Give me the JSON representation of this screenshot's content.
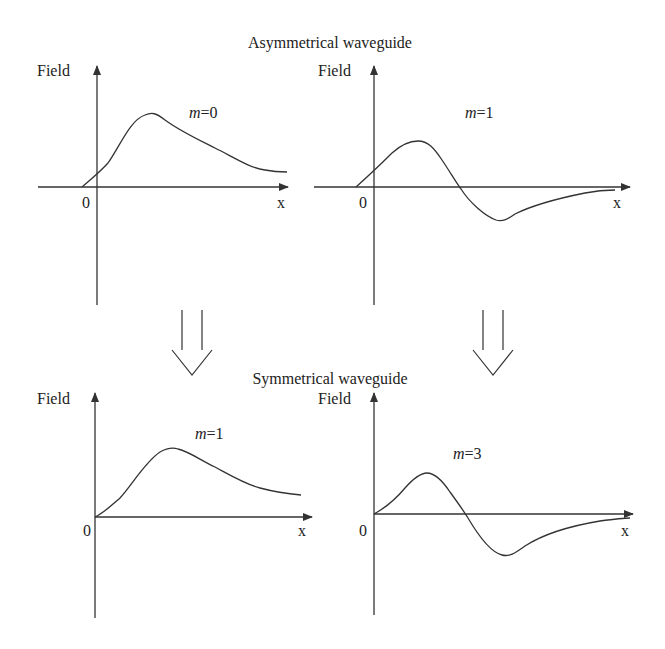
{
  "titles": {
    "top": "Asymmetrical waveguide",
    "bottom": "Symmetrical waveguide"
  },
  "panels": [
    {
      "id": "asym-m0",
      "y_label": "Field",
      "x_label": "x",
      "origin_label": "0",
      "mode_var": "m",
      "mode_eq": "=0"
    },
    {
      "id": "asym-m1",
      "y_label": "Field",
      "x_label": "x",
      "origin_label": "0",
      "mode_var": "m",
      "mode_eq": "=1"
    },
    {
      "id": "sym-m1",
      "y_label": "Field",
      "x_label": "x",
      "origin_label": "0",
      "mode_var": "m",
      "mode_eq": "=1"
    },
    {
      "id": "sym-m3",
      "y_label": "Field",
      "x_label": "x",
      "origin_label": "0",
      "mode_var": "m",
      "mode_eq": "=3"
    }
  ],
  "arrows": [
    {
      "id": "left-transform-arrow",
      "from": "asym-m0",
      "to": "sym-m1"
    },
    {
      "id": "right-transform-arrow",
      "from": "asym-m1",
      "to": "sym-m3"
    }
  ],
  "colors": {
    "line": "#333333",
    "text": "#222222",
    "background": "#ffffff"
  }
}
